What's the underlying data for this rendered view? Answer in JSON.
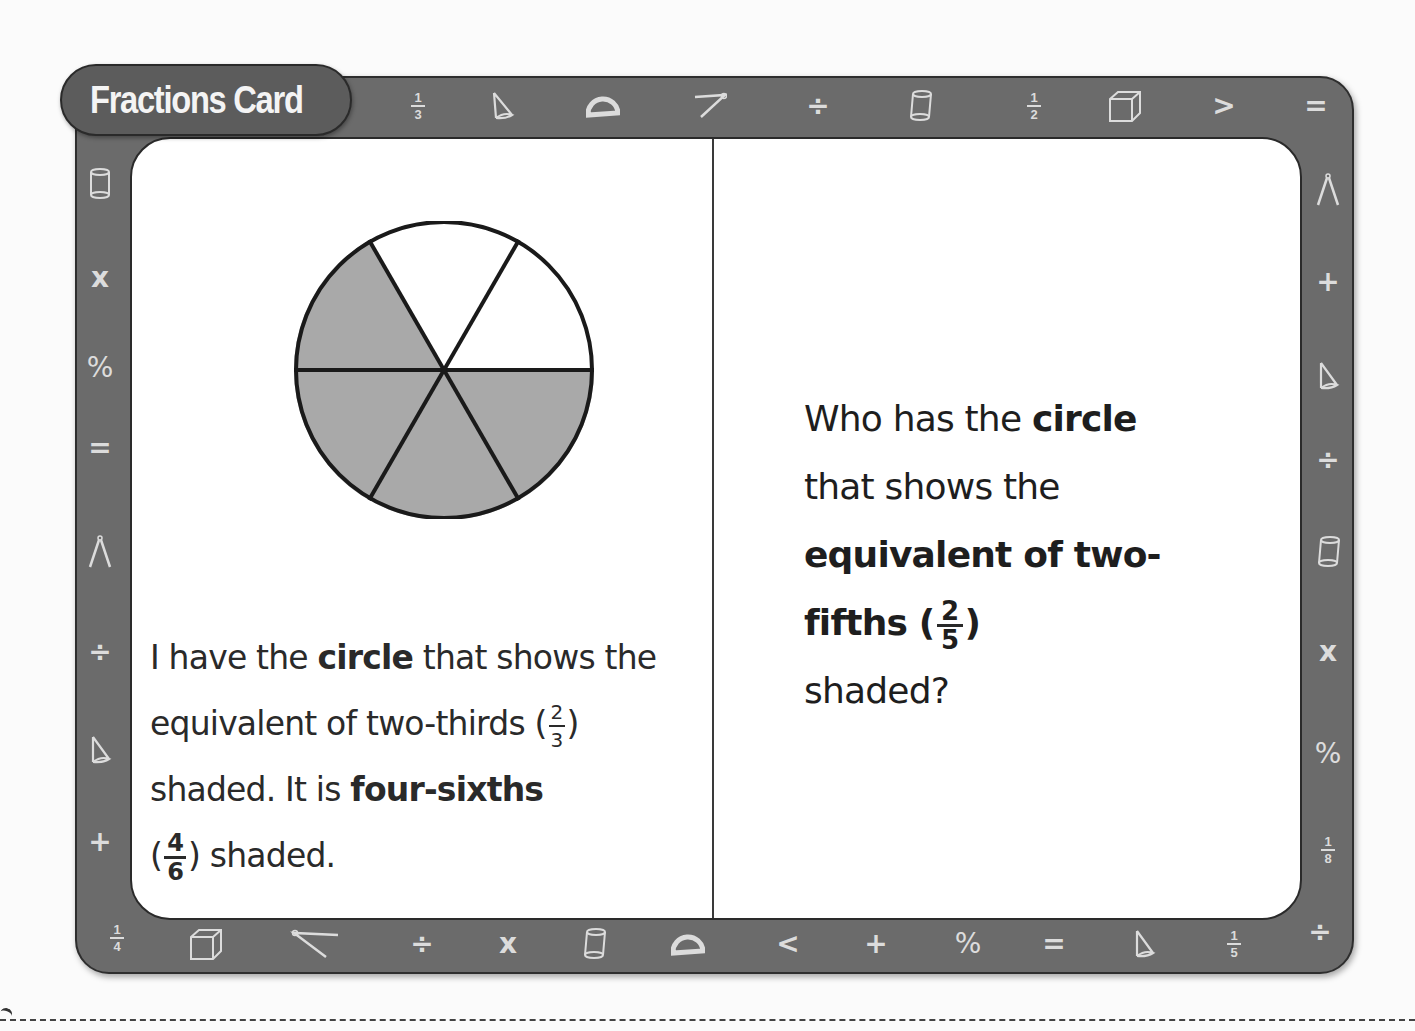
{
  "card": {
    "title": "Fractions Card",
    "frame_color": "#6b6b6b",
    "symbol_color": "#dcdcdc"
  },
  "border_symbols": {
    "top": [
      "fraction 1/3",
      "cone-icon",
      "protractor-icon",
      "compass-icon",
      "÷",
      "cylinder-icon",
      "fraction 1/2",
      "cube-icon",
      ">",
      "="
    ],
    "left": [
      "cylinder-icon",
      "x",
      "%",
      "=",
      "compass-icon",
      "÷",
      "cone-icon",
      "+",
      "fraction 1/4"
    ],
    "right": [
      "compass-icon",
      "+",
      "cone-icon",
      "÷",
      "cylinder-icon",
      "x",
      "%",
      "fraction 1/8",
      "÷"
    ],
    "bottom": [
      "cube-icon",
      "compass-icon",
      "÷",
      "x",
      "cylinder-icon",
      "protractor-icon",
      "<",
      "+",
      "%",
      "=",
      "cone-icon",
      "fraction 1/5"
    ]
  },
  "symbols": {
    "div": "÷",
    "gt": ">",
    "lt": "<",
    "eq": "=",
    "x": "x",
    "pct": "%",
    "plus": "+",
    "f13": {
      "n": "1",
      "d": "3"
    },
    "f12": {
      "n": "1",
      "d": "2"
    },
    "f14": {
      "n": "1",
      "d": "4"
    },
    "f18": {
      "n": "1",
      "d": "8"
    },
    "f15": {
      "n": "1",
      "d": "5"
    }
  },
  "figure": {
    "type": "pie",
    "slices": 6,
    "shaded": 4,
    "shade_color": "#a9a9a9"
  },
  "left_panel": {
    "t1": "I have the ",
    "t2": "circle",
    "t3": " that shows the equivalent of two-thirds (",
    "f1_num": "2",
    "f1_den": "3",
    "t4": ") shaded. It is ",
    "t5": "four-sixths",
    "t6": " (",
    "f2_num": "4",
    "f2_den": "6",
    "t7": ") shaded."
  },
  "right_panel": {
    "t1": "Who has the ",
    "t2": "circle",
    "t3": " that shows the ",
    "t4": "equivalent of two-fifths (",
    "f_num": "2",
    "f_den": "5",
    "t5": ")",
    "t6": " shaded?"
  }
}
